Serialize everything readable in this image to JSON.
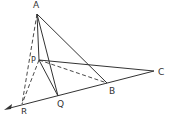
{
  "diagram": {
    "type": "geometry",
    "colors": {
      "stroke": "#333333",
      "label": "#333333",
      "background": "#ffffff"
    },
    "points": {
      "A": {
        "label": "A",
        "x": 37,
        "y": 14,
        "lx": 33,
        "ly": 8
      },
      "P": {
        "label": "P",
        "x": 39,
        "y": 60,
        "lx": 31,
        "ly": 62
      },
      "C": {
        "label": "C",
        "x": 154,
        "y": 71,
        "lx": 159,
        "ly": 75
      },
      "B": {
        "label": "B",
        "x": 107,
        "y": 83,
        "lx": 109,
        "ly": 94
      },
      "Q": {
        "label": "Q",
        "x": 58,
        "y": 96,
        "lx": 58,
        "ly": 107
      },
      "R": {
        "label": "R",
        "x": 22,
        "y": 104,
        "lx": 22,
        "ly": 114
      }
    },
    "segments": [
      {
        "from": "A",
        "to": "P",
        "style": "solid"
      },
      {
        "from": "A",
        "to": "Q",
        "style": "solid"
      },
      {
        "from": "A",
        "to": "B",
        "style": "solid"
      },
      {
        "from": "P",
        "to": "Q",
        "style": "solid"
      },
      {
        "from": "P",
        "to": "C",
        "style": "solid"
      },
      {
        "from": "C",
        "to": "R",
        "style": "solid"
      },
      {
        "from": "P",
        "to": "B",
        "style": "dashed"
      },
      {
        "from": "A",
        "to": "R",
        "style": "dashed"
      },
      {
        "from": "P",
        "to": "R",
        "style": "dashed"
      }
    ],
    "arrow": {
      "from": "R",
      "to_x": 5,
      "to_y": 110
    }
  }
}
